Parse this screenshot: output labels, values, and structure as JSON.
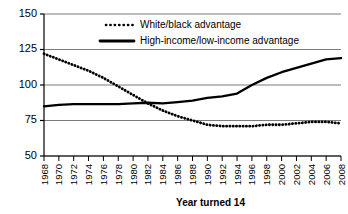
{
  "chart_data": {
    "type": "line",
    "title": "",
    "xlabel": "Year turned 14",
    "ylabel": "",
    "xlim": [
      1968,
      2008
    ],
    "ylim": [
      50,
      150
    ],
    "yticks": [
      50,
      75,
      100,
      125,
      150
    ],
    "grid": "horizontal",
    "legend_position": "top-center",
    "x": [
      1968,
      1970,
      1972,
      1974,
      1976,
      1978,
      1980,
      1982,
      1984,
      1986,
      1988,
      1990,
      1992,
      1994,
      1996,
      1998,
      2000,
      2002,
      2004,
      2006,
      2008
    ],
    "xtick_labels": [
      "1968",
      "1970",
      "1972",
      "1974",
      "1976",
      "1978",
      "1980",
      "1982",
      "1984",
      "1986",
      "1988",
      "1990",
      "1992",
      "1994",
      "1996",
      "1998",
      "2000",
      "2002",
      "2004",
      "2006",
      "2008"
    ],
    "series": [
      {
        "name": "White/black advantage",
        "style": "dotted",
        "color": "#000000",
        "values": [
          122,
          118,
          114,
          110,
          105,
          99,
          93,
          87,
          82,
          78,
          75,
          72,
          71,
          71,
          71,
          72,
          72,
          73,
          74,
          74,
          73
        ]
      },
      {
        "name": "High-income/low-income advantage",
        "style": "solid",
        "color": "#000000",
        "values": [
          85,
          86,
          86.5,
          86.5,
          86.5,
          86.5,
          87,
          87.5,
          87,
          88,
          89,
          91,
          92,
          94,
          100,
          105,
          109,
          112,
          115,
          118,
          119
        ]
      }
    ]
  },
  "legend": {
    "items": [
      {
        "label": "White/black advantage",
        "style": "dotted"
      },
      {
        "label": "High-income/low-income advantage",
        "style": "solid"
      }
    ]
  },
  "axis": {
    "x_title": "Year turned 14"
  },
  "colors": {
    "line": "#000000",
    "grid": "#6b6b6b",
    "axis": "#000000",
    "background": "#ffffff"
  }
}
